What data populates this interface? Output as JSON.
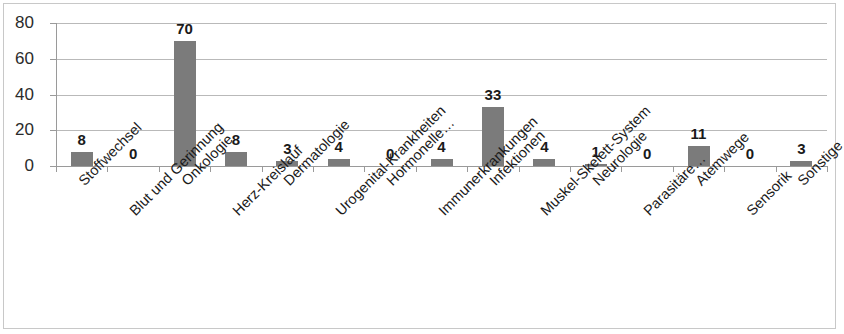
{
  "chart_data": {
    "type": "bar",
    "title": "",
    "subtitle": "",
    "xlabel": "",
    "ylabel": "",
    "ylim": [
      0,
      80
    ],
    "y_ticks": [
      "0",
      "20",
      "40",
      "60",
      "80"
    ],
    "grid": true,
    "legend": "none",
    "orientation": "vertical",
    "bar_color": "#7b7b7b",
    "categories": [
      "Stoffwechsel",
      "Blut und Gerinnung",
      "Onkologie",
      "Herz-Kreislauf",
      "Dermatologie",
      "Urogenital-Krankheiten",
      "Hormonelle…",
      "Immunerkrankungen",
      "Infektionen",
      "Muskel-Skelett-System",
      "Neurologie",
      "Parasitäre…",
      "Atemwege",
      "Sensorik",
      "Sonstige"
    ],
    "values": [
      8,
      0,
      70,
      8,
      3,
      4,
      0,
      4,
      33,
      4,
      1,
      0,
      11,
      0,
      3
    ],
    "data_labels": [
      "8",
      "0",
      "70",
      "8",
      "3",
      "4",
      "0",
      "4",
      "33",
      "4",
      "1",
      "0",
      "11",
      "0",
      "3"
    ]
  }
}
